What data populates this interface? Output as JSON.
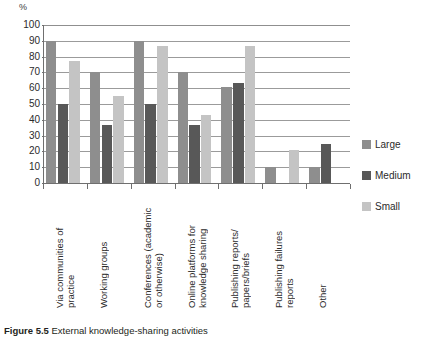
{
  "caption": {
    "label": "Figure 5.5",
    "text": "External knowledge-sharing activities"
  },
  "axis": {
    "y_unit": "%",
    "y_ticks": [
      "100",
      "90",
      "80",
      "70",
      "60",
      "50",
      "40",
      "30",
      "20",
      "10",
      "0"
    ]
  },
  "legend": {
    "items": [
      {
        "label": "Large",
        "color": "#8e8e8e"
      },
      {
        "label": "Medium",
        "color": "#585858"
      },
      {
        "label": "Small",
        "color": "#c4c4c4"
      }
    ]
  },
  "chart_data": {
    "type": "bar",
    "title": "External knowledge-sharing activities",
    "xlabel": "",
    "ylabel": "%",
    "ylim": [
      0,
      100
    ],
    "ytick_step": 10,
    "grid": true,
    "legend_position": "right",
    "categories": [
      "Via communities of\npractice",
      "Working groups",
      "Conferences (academic\nor otherwise)",
      "Online platforms for\nknowledge sharing",
      "Publishing reports/\npapers/briefs",
      "Publishing failures\nreports",
      "Other"
    ],
    "series": [
      {
        "name": "Large",
        "color": "#8e8e8e",
        "values": [
          90,
          70,
          90,
          70,
          61,
          10,
          10
        ]
      },
      {
        "name": "Medium",
        "color": "#585858",
        "values": [
          50,
          37,
          50,
          37,
          63,
          0,
          25
        ]
      },
      {
        "name": "Small",
        "color": "#c4c4c4",
        "values": [
          77,
          55,
          87,
          43,
          87,
          21,
          0
        ]
      }
    ]
  }
}
